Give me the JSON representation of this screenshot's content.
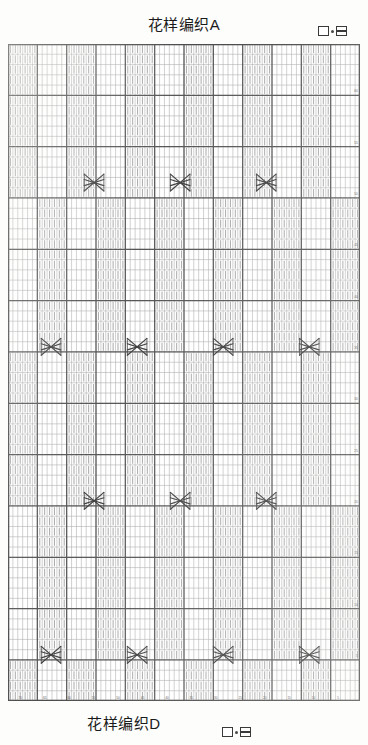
{
  "document": {
    "title_top": "花样编织A",
    "title_bottom": "花样编织D"
  },
  "legend_top": {
    "symbol_plain_name": "plain-square-symbol",
    "symbol_purl_name": "purl-square-symbol",
    "separator": "·"
  },
  "legend_bottom": {
    "symbol_plain_name": "plain-square-symbol",
    "symbol_purl_name": "purl-square-symbol",
    "separator": "·"
  },
  "chart": {
    "name": "knitting-pattern-chart",
    "columns": 72,
    "rows": 64,
    "cell_width": 4.85,
    "cell_height": 10.1,
    "grid_color": "#8e8e8e",
    "bold_grid_color": "#4a4a4a",
    "stitch_color": "#6e6e6e",
    "cable_color": "#3f3f3f",
    "background": "#ffffff",
    "bold_column_every": 6,
    "bold_row_every": 5,
    "row_number_side": "right",
    "column_number_side": "bottom",
    "row_numbers": [
      5,
      10,
      15,
      20,
      25,
      30,
      35,
      40,
      45,
      50,
      55,
      60
    ],
    "column_numbers": [
      5,
      10,
      15,
      20,
      25,
      30,
      35,
      40,
      45,
      50,
      55,
      60,
      65,
      70
    ],
    "cable_symbol": "cable-cross-x",
    "cable_span_columns": 4,
    "cable_rows": [
      {
        "row_y": 13,
        "phase": "offset",
        "centers": [
          90,
          180,
          270
        ]
      },
      {
        "row_y": 29,
        "phase": "base",
        "centers": [
          45,
          135,
          225,
          315
        ]
      },
      {
        "row_y": 44,
        "phase": "offset",
        "centers": [
          90,
          180,
          270
        ]
      },
      {
        "row_y": 59,
        "phase": "base",
        "centers": [
          45,
          135,
          225,
          315
        ]
      }
    ],
    "cable_phase_base_centers": [
      45,
      135,
      225,
      315
    ],
    "cable_phase_offset_centers": [
      90,
      180,
      270
    ],
    "stitch_block_pattern": "vertical-knit-marks",
    "stitch_block_width_columns": 6
  }
}
